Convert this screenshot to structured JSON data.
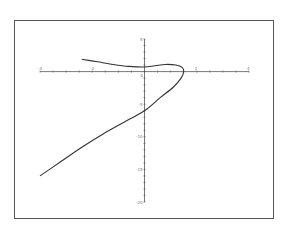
{
  "chart_data": {
    "type": "line",
    "title": "",
    "xlabel": "",
    "ylabel": "",
    "xlim": [
      -4,
      4
    ],
    "ylim": [
      -20,
      5
    ],
    "grid": false,
    "legend": null,
    "x_ticks": [
      -4,
      -2,
      0,
      2,
      4
    ],
    "y_ticks": [
      5,
      -5,
      -10,
      -15,
      -20
    ],
    "x_tick_labels": [
      "-4",
      "-2",
      "0",
      "2",
      "4"
    ],
    "y_tick_labels": [
      "5",
      "-5",
      "-10",
      "-15",
      "-20"
    ],
    "series": [
      {
        "name": "parametric curve",
        "color": "#333333",
        "points": [
          [
            -2.4,
            1.9
          ],
          [
            -1.8,
            1.5
          ],
          [
            -1.2,
            1.1
          ],
          [
            -0.6,
            0.8
          ],
          [
            0.0,
            0.7
          ],
          [
            0.4,
            0.9
          ],
          [
            0.8,
            1.1
          ],
          [
            1.2,
            1.0
          ],
          [
            1.45,
            0.6
          ],
          [
            1.5,
            0.0
          ],
          [
            1.4,
            -1.0
          ],
          [
            1.1,
            -2.4
          ],
          [
            0.6,
            -4.0
          ],
          [
            0.0,
            -6.0
          ],
          [
            -0.8,
            -7.8
          ],
          [
            -1.6,
            -9.6
          ],
          [
            -2.4,
            -11.6
          ],
          [
            -3.2,
            -13.8
          ],
          [
            -4.0,
            -16.0
          ]
        ]
      }
    ]
  },
  "colors": {
    "frame": "#555555",
    "axis": "#555555",
    "curve": "#333333",
    "background": "#ffffff"
  }
}
